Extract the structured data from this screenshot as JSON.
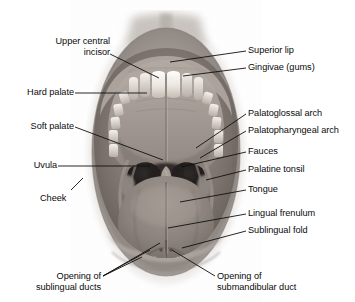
{
  "figure": {
    "image_name": "open-mouth-photograph",
    "background_color": "#ffffff",
    "label_color": "#0b0b0b",
    "leader_color": "#101010"
  },
  "labels": {
    "upper_central_incisor": {
      "line1": "Upper central",
      "line2": "incisor"
    },
    "hard_palate": {
      "line1": "Hard palate"
    },
    "soft_palate": {
      "line1": "Soft palate"
    },
    "uvula": {
      "line1": "Uvula"
    },
    "cheek": {
      "line1": "Cheek"
    },
    "superior_lip": {
      "line1": "Superior lip"
    },
    "gingivae": {
      "line1": "Gingivae (gums)"
    },
    "palatoglossal_arch": {
      "line1": "Palatoglossal arch"
    },
    "palatopharyngeal_arch": {
      "line1": "Palatopharyngeal arch"
    },
    "fauces": {
      "line1": "Fauces"
    },
    "palatine_tonsil": {
      "line1": "Palatine tonsil"
    },
    "tongue": {
      "line1": "Tongue"
    },
    "lingual_frenulum": {
      "line1": "Lingual frenulum"
    },
    "sublingual_fold": {
      "line1": "Sublingual fold"
    },
    "opening_sublingual_ducts": {
      "line1": "Opening of",
      "line2": "sublingual ducts"
    },
    "opening_submandibular_duct": {
      "line1": "Opening of",
      "line2": "submandibular duct"
    }
  }
}
